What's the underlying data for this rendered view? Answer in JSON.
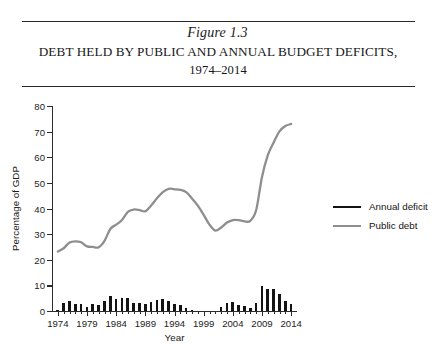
{
  "figure": {
    "number": "Figure 1.3",
    "title_line1": "DEBT HELD BY PUBLIC AND ANNUAL BUDGET DEFICITS,",
    "title_line2": "1974–2014"
  },
  "legend": {
    "position": "right",
    "items": [
      {
        "label": "Annual deficit",
        "color": "#131313",
        "width": 2.6
      },
      {
        "label": "Public debt",
        "color": "#8e8e8e",
        "width": 2.2
      }
    ]
  },
  "chart_data": {
    "type": "line",
    "xlabel": "Year",
    "ylabel": "Percentage of GDP",
    "xlim": [
      1973,
      2015
    ],
    "ylim": [
      0,
      80
    ],
    "yticks": [
      0,
      10,
      20,
      30,
      40,
      50,
      60,
      70,
      80
    ],
    "xticks": [
      1974,
      1979,
      1984,
      1989,
      1994,
      1999,
      2004,
      2009,
      2014
    ],
    "grid": false,
    "x": [
      1974,
      1975,
      1976,
      1977,
      1978,
      1979,
      1980,
      1981,
      1982,
      1983,
      1984,
      1985,
      1986,
      1987,
      1988,
      1989,
      1990,
      1991,
      1992,
      1993,
      1994,
      1995,
      1996,
      1997,
      1998,
      1999,
      2000,
      2001,
      2002,
      2003,
      2004,
      2005,
      2006,
      2007,
      2008,
      2009,
      2010,
      2011,
      2012,
      2013,
      2014
    ],
    "series": [
      {
        "name": "Public debt",
        "type": "line",
        "color": "#8e8e8e",
        "values": [
          23.2,
          24.5,
          26.7,
          27.2,
          26.8,
          25.2,
          25.0,
          24.9,
          27.4,
          32.0,
          33.7,
          35.5,
          38.7,
          39.6,
          39.4,
          38.9,
          41.2,
          44.0,
          46.4,
          47.7,
          47.5,
          47.3,
          46.4,
          43.9,
          41.1,
          37.5,
          33.7,
          31.4,
          32.6,
          34.5,
          35.5,
          35.5,
          35.0,
          35.2,
          39.4,
          52.3,
          60.8,
          65.8,
          70.1,
          72.2,
          73.0
        ]
      },
      {
        "name": "Annual deficit",
        "type": "bar",
        "color": "#131313",
        "values": [
          0.4,
          3.3,
          4.1,
          2.6,
          2.6,
          1.6,
          2.6,
          2.5,
          3.9,
          5.9,
          4.7,
          5.0,
          4.9,
          3.1,
          3.0,
          2.7,
          3.7,
          4.4,
          4.5,
          3.8,
          2.8,
          2.2,
          1.3,
          0.3,
          0.0,
          0.0,
          0.0,
          0.0,
          1.5,
          3.3,
          3.4,
          2.5,
          1.8,
          1.1,
          3.1,
          9.8,
          8.7,
          8.4,
          6.7,
          4.1,
          2.8
        ]
      }
    ]
  }
}
